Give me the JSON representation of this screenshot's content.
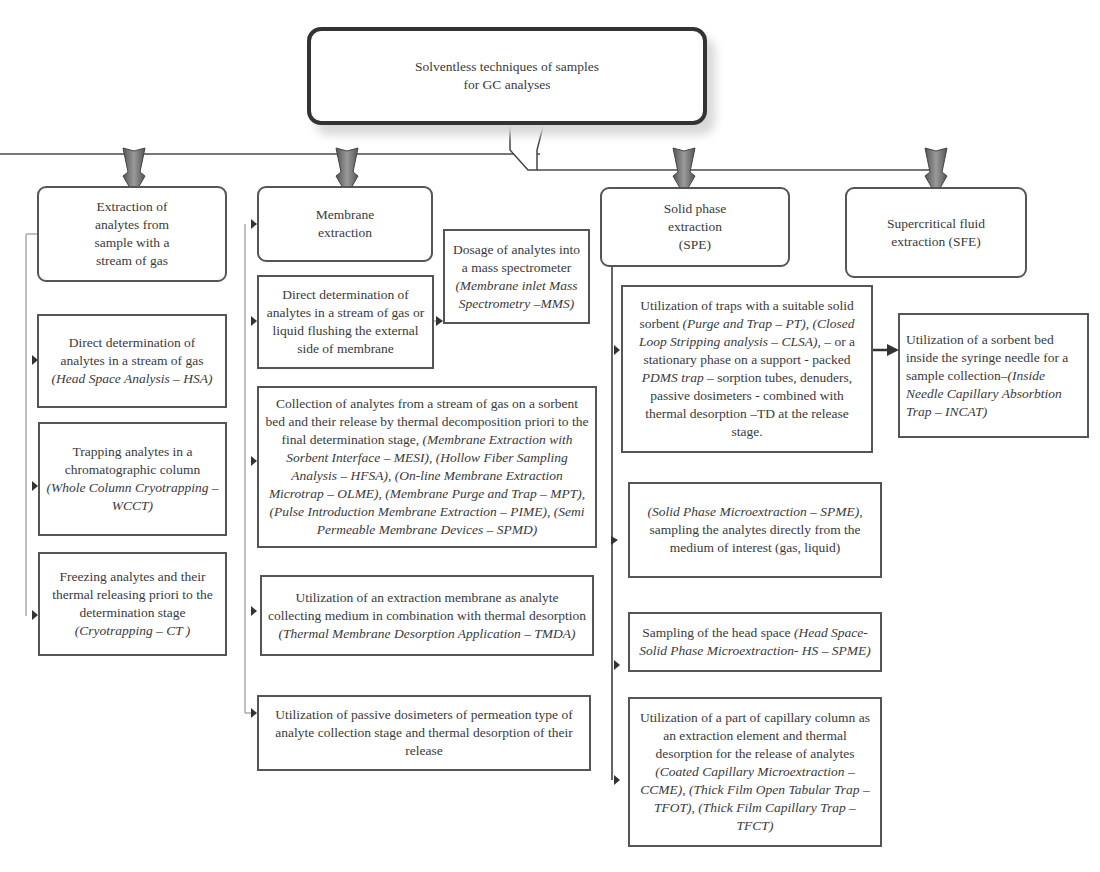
{
  "root": {
    "title": "Solventless techniques of samples for GC analyses"
  },
  "categories": [
    {
      "id": "gas",
      "label": "Extraction of analytes from sample with a stream of gas"
    },
    {
      "id": "membrane",
      "label": "Membrane extraction"
    },
    {
      "id": "spe",
      "label": "Solid phase extraction (SPE)"
    },
    {
      "id": "sfe",
      "label": "Supercritical fluid extraction (SFE)"
    }
  ],
  "gas_items": [
    {
      "text": "Direct determination of analytes in a stream of gas",
      "italic": "(Head Space Analysis – HSA)"
    },
    {
      "text": "Trapping analytes in a chromatographic column",
      "italic": "(Whole Column Cryotrapping – WCCT)"
    },
    {
      "text": "Freezing analytes and their thermal releasing priori to the determination stage",
      "italic": "(Cryotrapping – CT )"
    }
  ],
  "membrane_items": [
    {
      "text": "Direct determination of analytes in a stream of gas or liquid flushing the external side of membrane"
    },
    {
      "text": "Collection of analytes from a stream of gas on a sorbent bed and their release by thermal decomposition priori to the final determination stage,",
      "italic": "(Membrane Extraction with Sorbent Interface – MESI), (Hollow Fiber Sampling Analysis – HFSA), (On-line Membrane Extraction Microtrap – OLME), (Membrane Purge and Trap – MPT), (Pulse Introduction Membrane Extraction – PIME), (Semi Permeable Membrane Devices – SPMD)"
    },
    {
      "text": "Utilization of an extraction membrane as analyte collecting medium in combination with thermal desorption",
      "italic": "(Thermal Membrane Desorption Application – TMDA)"
    },
    {
      "text": "Utilization of passive dosimeters of permeation type of analyte collection stage and thermal desorption of their release"
    }
  ],
  "membrane_sub": {
    "text": "Dosage of analytes into a mass spectrometer",
    "italic": "(Membrane inlet Mass Spectrometry –MMS)"
  },
  "spe_items": [
    {
      "text_a": "Utilization of traps with a suitable solid sorbent",
      "italic_a": "(Purge and Trap – PT), (Closed Loop Stripping analysis – CLSA),",
      "text_b": "– or a stationary phase on a support - packed",
      "italic_b": "PDMS trap",
      "text_c": "– sorption tubes, denuders, passive dosimeters - combined with thermal desorption –TD at the release stage."
    },
    {
      "italic": "(Solid Phase Microextraction – SPME),",
      "text": "sampling the analytes directly from the medium of interest (gas, liquid)"
    },
    {
      "text": "Sampling of the head space",
      "italic": "(Head Space- Solid Phase Microextraction- HS – SPME)"
    },
    {
      "text": "Utilization of a part of capillary column as an extraction element and thermal desorption for the release of analytes",
      "italic": "(Coated Capillary Microextraction – CCME), (Thick Film Open Tabular Trap – TFOT), (Thick Film Capillary Trap – TFCT)"
    }
  ],
  "spe_sub": {
    "text": "Utilization of a sorbent bed inside the syringe needle for a sample collection–",
    "italic": "(Inside Needle Capillary Absorbtion Trap – INCAT)"
  }
}
